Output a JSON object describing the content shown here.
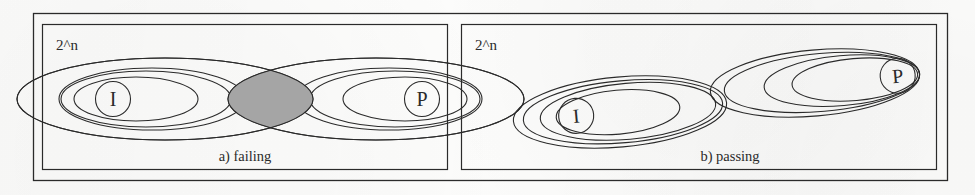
{
  "figure": {
    "kind": "venn-diagram-figure",
    "background_color": "#fdfdfc",
    "stroke_color": "#2b2b2b",
    "shade_color": "#a8a8a8",
    "panels": [
      {
        "id": "panel-a",
        "caption": "a) failing",
        "universe_label": "2^n",
        "groups": [
          {
            "id": "group-i",
            "letter": "I",
            "ellipse_count": 4
          },
          {
            "id": "group-p",
            "letter": "P",
            "ellipse_count": 4
          }
        ],
        "overlap": {
          "present": true,
          "shape": "lens",
          "fill": "#a8a8a8"
        }
      },
      {
        "id": "panel-b",
        "caption": "b) passing",
        "universe_label": "2^n",
        "groups": [
          {
            "id": "group-i",
            "letter": "I",
            "ellipse_count": 4
          },
          {
            "id": "group-p",
            "letter": "P",
            "ellipse_count": 4
          }
        ],
        "overlap": {
          "present": false,
          "shape": "none",
          "fill": ""
        }
      }
    ]
  }
}
